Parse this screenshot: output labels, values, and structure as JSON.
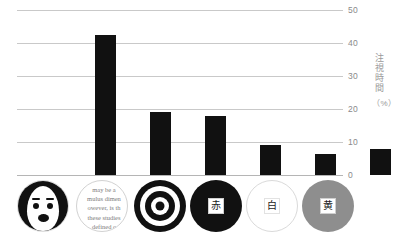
{
  "chart_data": {
    "type": "bar",
    "title": "",
    "subtitle": "",
    "xlabel": "",
    "ylabel": "注視時間",
    "yunit": "（%）",
    "ylim": [
      0,
      50
    ],
    "yticks": [
      0,
      10,
      20,
      30,
      40,
      50
    ],
    "ytick_labels": [
      "0",
      "10",
      "20",
      "30",
      "40",
      "50"
    ],
    "grid": true,
    "legend": false,
    "bar_color": "#111111",
    "grid_color": "#c9c9c9",
    "categories": [
      "face",
      "scrambled-face",
      "bullseye",
      "red-disc",
      "white-disc",
      "yellow-disc"
    ],
    "category_labels": [
      "顔",
      "",
      "同心円",
      "赤",
      "白",
      "黄"
    ],
    "values": [
      42.5,
      19,
      18,
      9,
      6.5,
      8
    ]
  },
  "axis": {
    "title_text": "注視時間",
    "unit_text": "（%）"
  },
  "icons": [
    {
      "name": "face-icon",
      "kind": "face",
      "caption": ""
    },
    {
      "name": "scrambled-face-icon",
      "kind": "scrambled",
      "ghost_text": "may be a\nmulus dimen\nowever, is th\nthese studies\ndefined c"
    },
    {
      "name": "bullseye-icon",
      "kind": "bullseye",
      "caption": ""
    },
    {
      "name": "red-disc-icon",
      "kind": "swatch-red",
      "kanji": "赤"
    },
    {
      "name": "white-disc-icon",
      "kind": "swatch-white",
      "kanji": "白"
    },
    {
      "name": "yellow-disc-icon",
      "kind": "swatch-yellow",
      "kanji": "黄"
    }
  ]
}
